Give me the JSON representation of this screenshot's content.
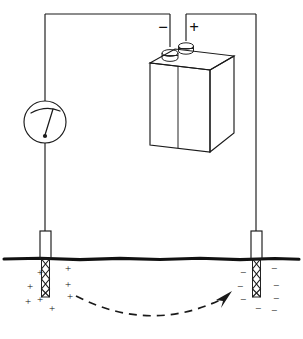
{
  "figure": {
    "type": "line-diagram",
    "width": 303,
    "height": 339,
    "background_color": "#ffffff",
    "ink_color": "#1a1a1a"
  },
  "battery": {
    "label": "battery",
    "negative_terminal_sign": "−",
    "positive_terminal_sign": "+",
    "terminal_count": 2,
    "shape": "isometric-box"
  },
  "meter": {
    "label": "meter",
    "shape": "circle-with-needle",
    "reading_text": ""
  },
  "electrodes": {
    "left": {
      "name": "left-electrode",
      "polarity_label": "+",
      "charge_symbol": "+",
      "charge_count": 8,
      "buried": true
    },
    "right": {
      "name": "right-electrode",
      "polarity_label": "−",
      "charge_symbol": "−",
      "charge_count": 8,
      "buried": true
    }
  },
  "ground": {
    "label": "ground-surface-line",
    "y": 259
  },
  "current_arrow": {
    "label": "current-flow-arrow",
    "style": "dashed-arc",
    "direction": "left-to-right"
  },
  "charges": {
    "left_positions": [
      {
        "x": 40,
        "y": 276
      },
      {
        "x": 68,
        "y": 272
      },
      {
        "x": 30,
        "y": 290
      },
      {
        "x": 68,
        "y": 288
      },
      {
        "x": 40,
        "y": 303
      },
      {
        "x": 70,
        "y": 300
      },
      {
        "x": 28,
        "y": 305
      },
      {
        "x": 52,
        "y": 311
      }
    ],
    "right_positions": [
      {
        "x": 243,
        "y": 276
      },
      {
        "x": 273,
        "y": 272
      },
      {
        "x": 240,
        "y": 290
      },
      {
        "x": 275,
        "y": 289
      },
      {
        "x": 243,
        "y": 303
      },
      {
        "x": 275,
        "y": 302
      },
      {
        "x": 258,
        "y": 311
      },
      {
        "x": 272,
        "y": 313
      }
    ]
  }
}
